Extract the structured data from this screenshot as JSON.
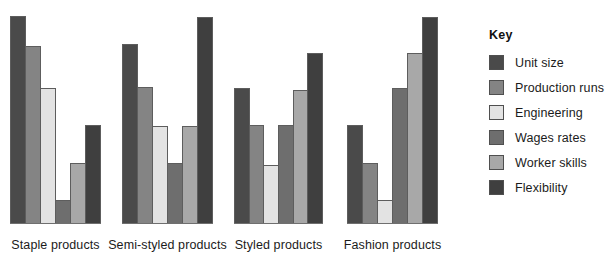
{
  "chart_data": {
    "type": "bar",
    "title": "",
    "subtitle": "",
    "xlabel": "",
    "ylabel": "",
    "grid": false,
    "legend_position": "right",
    "legend_title": "Key",
    "ylim": [
      0,
      6
    ],
    "categories": [
      "Staple products",
      "Semi-styled products",
      "Styled products",
      "Fashion products"
    ],
    "series": [
      {
        "name": "Unit size",
        "color": "#4a4a4a",
        "values": [
          6.0,
          5.0,
          4.0,
          3.0
        ]
      },
      {
        "name": "Production runs",
        "color": "#848484",
        "values": [
          5.5,
          4.0,
          3.0,
          2.0
        ]
      },
      {
        "name": "Engineering",
        "color": "#e3e3e3",
        "values": [
          4.0,
          3.0,
          2.0,
          1.0
        ]
      },
      {
        "name": "Wages rates",
        "color": "#6e6e6e",
        "values": [
          1.0,
          2.0,
          3.0,
          4.0
        ]
      },
      {
        "name": "Worker skills",
        "color": "#a8a8a8",
        "values": [
          2.0,
          3.0,
          4.0,
          5.0
        ]
      },
      {
        "name": "Flexibility",
        "color": "#3f3f3f",
        "values": [
          3.0,
          6.0,
          5.0,
          6.0
        ]
      }
    ],
    "bar_heights_px": [
      [
        208,
        178,
        136,
        24,
        61,
        99
      ],
      [
        180,
        137,
        98,
        61,
        98,
        207
      ],
      [
        136,
        99,
        59,
        99,
        134,
        171
      ],
      [
        99,
        61,
        24,
        136,
        171,
        207
      ]
    ]
  },
  "legend": {
    "title": "Key",
    "items": [
      {
        "label": "Unit size",
        "color": "#4a4a4a"
      },
      {
        "label": "Production runs",
        "color": "#848484"
      },
      {
        "label": "Engineering",
        "color": "#e3e3e3"
      },
      {
        "label": "Wages rates",
        "color": "#6e6e6e"
      },
      {
        "label": "Worker skills",
        "color": "#a8a8a8"
      },
      {
        "label": "Flexibility",
        "color": "#3f3f3f"
      }
    ]
  },
  "axis": {
    "group_labels": [
      "Staple products",
      "Semi-styled products",
      "Styled products",
      "Fashion products"
    ]
  }
}
